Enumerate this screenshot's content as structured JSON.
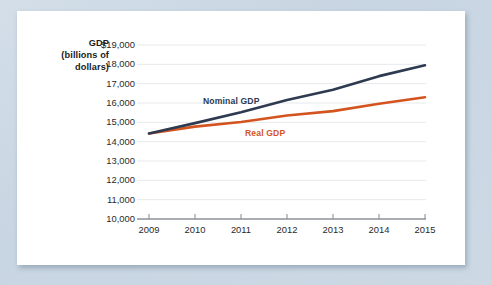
{
  "axis_title": {
    "line1": "GDP",
    "line2": "(billions of",
    "line3": "dollars)"
  },
  "y_tick_labels": [
    "$19,000",
    "18,000",
    "17,000",
    "16,000",
    "15,000",
    "14,000",
    "13,000",
    "12,000",
    "11,000",
    "10,000"
  ],
  "x_tick_labels": [
    "2009",
    "2010",
    "2011",
    "2012",
    "2013",
    "2014",
    "2015"
  ],
  "series_tags": {
    "nominal": "Nominal GDP",
    "real": "Real GDP"
  },
  "colors": {
    "nominal": "#2d3a50",
    "real": "#d4541f",
    "gridline": "#e6e9ec",
    "axis": "#8d9299",
    "card": "#ffffff",
    "page_background": "#ccd8e4"
  },
  "chart_data": {
    "type": "line",
    "title": "",
    "xlabel": "",
    "ylabel": "GDP (billions of dollars)",
    "x": [
      "2009",
      "2010",
      "2011",
      "2012",
      "2013",
      "2014",
      "2015"
    ],
    "xlim": [
      "2009",
      "2015"
    ],
    "ylim": [
      10000,
      19000
    ],
    "y_ticks": [
      10000,
      11000,
      12000,
      13000,
      14000,
      15000,
      16000,
      17000,
      18000,
      19000
    ],
    "grid": true,
    "legend": "inline-labels",
    "series": [
      {
        "name": "Nominal GDP",
        "color": "#2d3a50",
        "values": [
          14420,
          14960,
          15520,
          16160,
          16690,
          17390,
          17950
        ]
      },
      {
        "name": "Real GDP",
        "color": "#d4541f",
        "values": [
          14420,
          14780,
          15020,
          15350,
          15580,
          15960,
          16300
        ]
      }
    ]
  }
}
